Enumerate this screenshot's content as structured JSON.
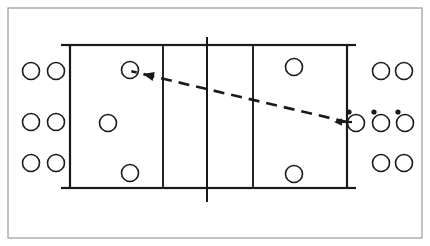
{
  "figure": {
    "kind": "volleyball-court-diagram",
    "title": "",
    "caption": "",
    "width": 430,
    "height": 246,
    "background_color": "#ffffff",
    "line_color": "#1a1a1a",
    "frame_color": "#9a9a9a"
  },
  "frame": {
    "x": 8,
    "y": 8,
    "width": 414,
    "height": 230,
    "stroke_width": 1.2
  },
  "court": {
    "x": 70,
    "y": 45,
    "width": 277,
    "height": 143,
    "stroke_width": 2.2,
    "end_line_ticks": [
      {
        "name": "tick-top-left",
        "x1": 61,
        "y1": 45,
        "x2": 69,
        "y2": 45
      },
      {
        "name": "tick-top-right",
        "x1": 348,
        "y1": 45,
        "x2": 356,
        "y2": 45
      },
      {
        "name": "tick-bottom-left",
        "x1": 61,
        "y1": 188,
        "x2": 69,
        "y2": 188
      },
      {
        "name": "tick-bottom-right",
        "x1": 348,
        "y1": 188,
        "x2": 356,
        "y2": 188
      }
    ],
    "attack_lines": [
      {
        "name": "attack-line-left",
        "x": 163,
        "y1": 45,
        "y2": 188
      },
      {
        "name": "attack-line-right",
        "x": 253,
        "y1": 45,
        "y2": 188
      }
    ],
    "net_line": {
      "name": "net-line",
      "x": 207,
      "y1": 37,
      "y2": 202
    }
  },
  "players_on_court": [
    {
      "id": "court-p1",
      "label": "",
      "cx": 130,
      "cy": 70,
      "r": 8.5
    },
    {
      "id": "court-p2",
      "label": "",
      "cx": 108,
      "cy": 123,
      "r": 8.5
    },
    {
      "id": "court-p3",
      "label": "",
      "cx": 130,
      "cy": 173,
      "r": 8.5
    },
    {
      "id": "court-p4",
      "label": "",
      "cx": 294,
      "cy": 67,
      "r": 8.5
    },
    {
      "id": "court-p5",
      "label": "",
      "cx": 294,
      "cy": 174,
      "r": 8.5
    }
  ],
  "players_left_queue": [
    {
      "id": "left-q-r1c1",
      "cx": 31,
      "cy": 71,
      "r": 8.5
    },
    {
      "id": "left-q-r1c2",
      "cx": 56,
      "cy": 71,
      "r": 8.5
    },
    {
      "id": "left-q-r2c1",
      "cx": 31,
      "cy": 122,
      "r": 8.5
    },
    {
      "id": "left-q-r2c2",
      "cx": 56,
      "cy": 122,
      "r": 8.5
    },
    {
      "id": "left-q-r3c1",
      "cx": 31,
      "cy": 163,
      "r": 8.5
    },
    {
      "id": "left-q-r3c2",
      "cx": 56,
      "cy": 163,
      "r": 8.5
    }
  ],
  "players_right_queue": [
    {
      "id": "right-q-r1c1",
      "cx": 381,
      "cy": 71,
      "r": 8.5
    },
    {
      "id": "right-q-r1c2",
      "cx": 404,
      "cy": 71,
      "r": 8.5
    },
    {
      "id": "right-q-r3c1",
      "cx": 381,
      "cy": 163,
      "r": 8.5
    },
    {
      "id": "right-q-r3c2",
      "cx": 404,
      "cy": 163,
      "r": 8.5
    }
  ],
  "servers_with_balls": [
    {
      "id": "server-1",
      "cx": 356,
      "cy": 123,
      "r": 8.5,
      "ball": {
        "cx": 349,
        "cy": 112,
        "r": 2.6
      }
    },
    {
      "id": "server-2",
      "cx": 381,
      "cy": 123,
      "r": 8.5,
      "ball": {
        "cx": 374,
        "cy": 112,
        "r": 2.6
      }
    },
    {
      "id": "server-3",
      "cx": 405,
      "cy": 123,
      "r": 8.5,
      "ball": {
        "cx": 398,
        "cy": 112,
        "r": 2.6
      }
    }
  ],
  "arrows": {
    "dashed_flight_path": {
      "name": "ball-flight-path",
      "x1": 347,
      "y1": 122,
      "x2": 143,
      "y2": 74,
      "dash_pattern": "11 7",
      "stroke_width": 2.6,
      "head_at": "start-end"
    },
    "short_entry_arrow": {
      "name": "serve-entry-arrow",
      "x1": 352,
      "y1": 122,
      "x2": 334,
      "y2": 122,
      "stroke_width": 2.2
    }
  },
  "legend": {
    "circle_meaning": "player",
    "dot_meaning": "ball",
    "dashed_meaning": "ball trajectory"
  }
}
